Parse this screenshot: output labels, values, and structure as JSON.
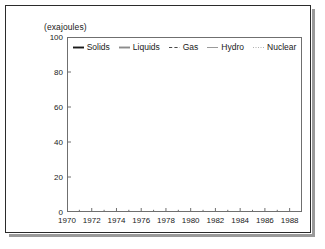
{
  "chart_data": {
    "type": "line",
    "title": "",
    "subtitle": "",
    "xlabel": "",
    "ylabel": "(exajoules)",
    "ylim": [
      0,
      100
    ],
    "xlim": [
      1970,
      1989
    ],
    "yticks": [
      0,
      20,
      40,
      60,
      80,
      100
    ],
    "xticks": [
      1970,
      1972,
      1974,
      1976,
      1978,
      1980,
      1982,
      1984,
      1986,
      1988
    ],
    "x_minor_step": 1,
    "grid": false,
    "legend_position": "top-center",
    "x": [
      1970,
      1971,
      1972,
      1973,
      1974,
      1975,
      1976,
      1977,
      1978,
      1979,
      1980,
      1981,
      1982,
      1983,
      1984,
      1985,
      1986,
      1987,
      1988,
      1989
    ],
    "series": [
      {
        "name": "Solids",
        "style": "solid",
        "color": "#1a1a1a",
        "width": 1.9,
        "values": [
          50.5,
          50.0,
          49.0,
          49.5,
          50.5,
          50.0,
          51.5,
          52.5,
          53.0,
          54.5,
          55.5,
          55.5,
          55.5,
          56.5,
          57.5,
          60.5,
          60.0,
          61.5,
          64.0,
          63.0
        ]
      },
      {
        "name": "Liquids",
        "style": "solid",
        "color": "#8c8c8c",
        "width": 1.9,
        "values": [
          72.0,
          76.5,
          81.5,
          86.5,
          84.5,
          83.5,
          87.5,
          89.5,
          91.5,
          94.0,
          90.5,
          86.0,
          83.0,
          81.5,
          82.0,
          81.0,
          83.5,
          85.5,
          87.0,
          88.0
        ]
      },
      {
        "name": "Gas",
        "style": "dashed",
        "color": "#4a4a4a",
        "width": 1.2,
        "values": [
          36.0,
          38.0,
          39.5,
          41.0,
          41.5,
          42.0,
          43.5,
          44.0,
          45.5,
          47.5,
          48.0,
          48.5,
          48.5,
          49.5,
          52.0,
          53.0,
          53.5,
          55.5,
          58.0,
          60.0
        ]
      },
      {
        "name": "Hydro",
        "style": "solid",
        "color": "#9a9a9a",
        "width": 0.9,
        "values": [
          3.6,
          3.7,
          3.8,
          3.9,
          4.1,
          4.2,
          4.3,
          4.4,
          4.5,
          4.6,
          4.7,
          4.8,
          4.9,
          5.0,
          5.1,
          5.2,
          5.3,
          5.4,
          5.5,
          5.5
        ]
      },
      {
        "name": "Nuclear",
        "style": "dotted",
        "color": "#b0b0b0",
        "width": 0.9,
        "values": [
          0.2,
          0.3,
          0.4,
          0.5,
          0.7,
          0.9,
          1.1,
          1.4,
          1.7,
          2.0,
          2.3,
          2.7,
          3.0,
          3.4,
          3.9,
          4.4,
          4.7,
          4.9,
          5.1,
          5.2
        ]
      }
    ]
  },
  "legend": {
    "items": [
      {
        "label": "Solids"
      },
      {
        "label": "Liquids"
      },
      {
        "label": "Gas"
      },
      {
        "label": "Hydro"
      },
      {
        "label": "Nuclear"
      }
    ]
  },
  "axes": {
    "y_unit_label": "(exajoules)"
  }
}
